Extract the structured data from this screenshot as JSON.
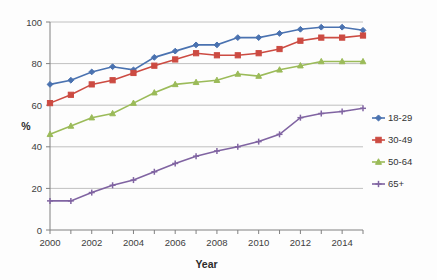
{
  "chart_data": {
    "type": "line",
    "title": "",
    "xlabel": "Year",
    "ylabel": "%",
    "xlim": [
      2000,
      2015
    ],
    "ylim": [
      0,
      100
    ],
    "grid": true,
    "legend_position": "right",
    "x": [
      2000,
      2001,
      2002,
      2003,
      2004,
      2005,
      2006,
      2007,
      2008,
      2009,
      2010,
      2011,
      2012,
      2013,
      2014,
      2015
    ],
    "x_tick_labels": [
      "2000",
      "2002",
      "2004",
      "2006",
      "2008",
      "2010",
      "2012",
      "2014"
    ],
    "x_ticks": [
      2000,
      2002,
      2004,
      2006,
      2008,
      2010,
      2012,
      2014
    ],
    "y_ticks": [
      0,
      20,
      40,
      60,
      80,
      100
    ],
    "y_tick_labels": [
      "0",
      "20",
      "40",
      "60",
      "80",
      "100"
    ],
    "series": [
      {
        "name": "18-29",
        "color": "#4a72b0",
        "marker": "diamond",
        "values": [
          70,
          72,
          76,
          78.5,
          77,
          83,
          86,
          89,
          89,
          92.5,
          92.5,
          94.5,
          96.5,
          97.5,
          97.5,
          96
        ]
      },
      {
        "name": "30-49",
        "color": "#cc4b42",
        "marker": "square",
        "values": [
          61,
          65,
          70,
          72,
          75.5,
          79,
          82,
          85,
          84,
          84,
          85,
          87,
          91,
          92.5,
          92.5,
          93.5
        ]
      },
      {
        "name": "50-64",
        "color": "#9bbb59",
        "marker": "triangle",
        "values": [
          46,
          50,
          54,
          56,
          61,
          66,
          70,
          71,
          72,
          75,
          74,
          77,
          79,
          81,
          81,
          81
        ]
      },
      {
        "name": "65+",
        "color": "#8064a2",
        "marker": "cross",
        "values": [
          14,
          14,
          18,
          21.5,
          24,
          28,
          32,
          35.5,
          38,
          40,
          42.5,
          46,
          54,
          56,
          57,
          58.5
        ]
      }
    ]
  },
  "legend": {
    "entries": [
      {
        "label": "18-29"
      },
      {
        "label": "30-49"
      },
      {
        "label": "50-64"
      },
      {
        "label": "65+"
      }
    ]
  }
}
